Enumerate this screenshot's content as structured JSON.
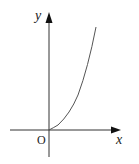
{
  "diagram": {
    "type": "function-graph",
    "axes": {
      "x_label": "x",
      "y_label": "y",
      "origin_label": "O"
    },
    "curve": {
      "description": "increasing convex curve starting at origin, defined for x >= 0",
      "shape": "y = k x^2 (x >= 0)"
    },
    "colors": {
      "axis": "#222222",
      "curve": "#555555",
      "background": "#ffffff"
    }
  }
}
